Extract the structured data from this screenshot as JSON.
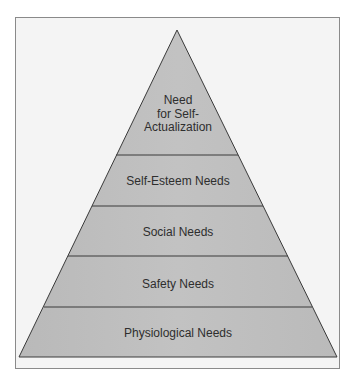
{
  "diagram": {
    "type": "pyramid",
    "colors": {
      "fill": "#bdbdbd",
      "stroke": "#3a3a3a",
      "frame": "#8a8a8a",
      "background": "#f4f4f4",
      "text": "#2e2e2e"
    },
    "levels": [
      {
        "lines": [
          "Need",
          "for Self-",
          "Actualization"
        ]
      },
      {
        "label": "Self-Esteem Needs"
      },
      {
        "label": "Social Needs"
      },
      {
        "label": "Safety Needs"
      },
      {
        "label": "Physiological Needs"
      }
    ]
  }
}
